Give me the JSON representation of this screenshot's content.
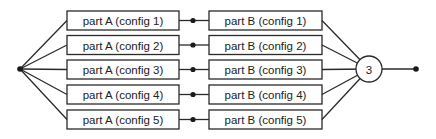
{
  "diagram": {
    "title": "",
    "colors": {
      "stroke": "#2a2a2a",
      "text": "#222222",
      "background": "#ffffff"
    },
    "input_node": {
      "x": 20,
      "y": 69
    },
    "output_node": {
      "x": 416,
      "y": 69
    },
    "voter": {
      "label": "3",
      "cx": 369,
      "cy": 69,
      "r": 13
    },
    "rows": [
      {
        "part_a": "part A (config  1)",
        "part_b": "part B (config  1)",
        "y": 20.5
      },
      {
        "part_a": "part A (config  2)",
        "part_b": "part B (config  2)",
        "y": 45
      },
      {
        "part_a": "part A (config  3)",
        "part_b": "part B (config  3)",
        "y": 69.5
      },
      {
        "part_a": "part A (config  4)",
        "part_b": "part B (config  4)",
        "y": 94.5
      },
      {
        "part_a": "part A (config  5)",
        "part_b": "part B (config  5)",
        "y": 119.5
      }
    ],
    "layout": {
      "box_a_x": 67,
      "box_a_w": 112,
      "box_b_x": 209,
      "box_b_w": 113,
      "box_h": 19,
      "junction_x": 193
    }
  }
}
